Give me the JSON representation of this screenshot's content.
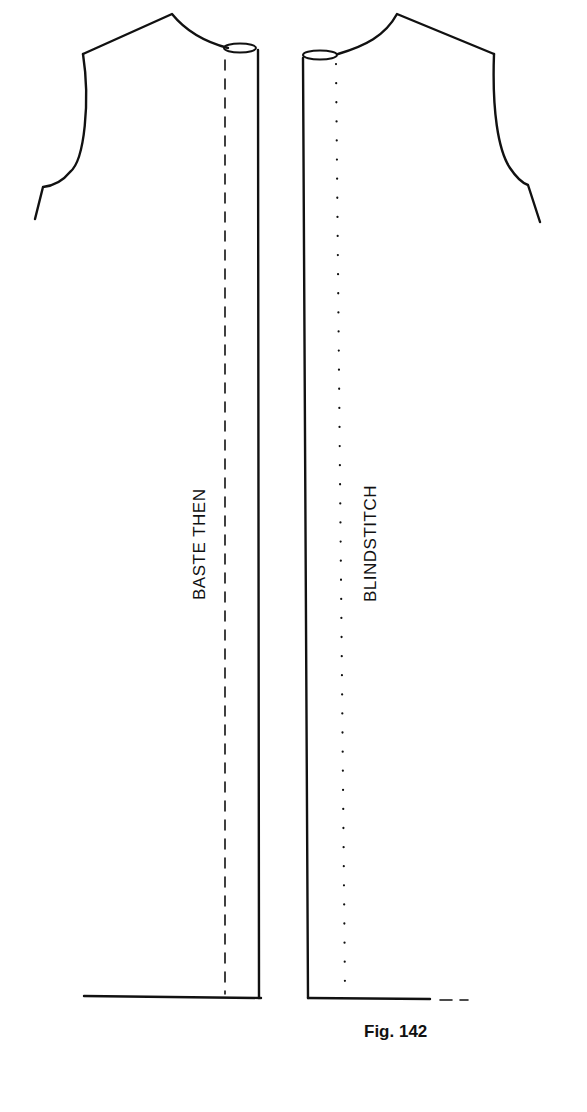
{
  "figure": {
    "caption": "Fig. 142",
    "labels": {
      "left_panel": "BASTE THEN",
      "right_panel": "BLINDSTITCH"
    },
    "colors": {
      "ink": "#111111",
      "background": "#ffffff"
    },
    "pieces": [
      {
        "name": "left-front-piece",
        "stitch": "dashed",
        "stitch_label": "BASTE THEN"
      },
      {
        "name": "right-front-piece",
        "stitch": "dotted",
        "stitch_label": "BLINDSTITCH"
      }
    ]
  }
}
